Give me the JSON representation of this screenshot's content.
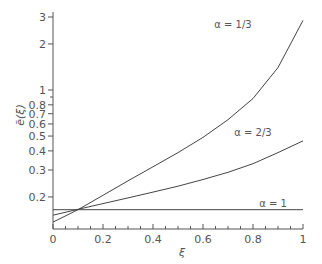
{
  "chart_data": {
    "type": "line",
    "title": "",
    "xlabel": "ξ",
    "ylabel": "ẽ(ξ)",
    "xlim": [
      0,
      1
    ],
    "ylim": [
      0.13,
      3.2
    ],
    "yscale": "log",
    "grid": false,
    "legend": "inline labels",
    "x_ticks": [
      0,
      0.2,
      0.4,
      0.6,
      0.8,
      1
    ],
    "x_tick_labels": [
      "0",
      "0.2",
      "0.4",
      "0.6",
      "0.8",
      "1"
    ],
    "x_minor_step": 0.05,
    "y_ticks": [
      0.2,
      0.3,
      0.4,
      0.5,
      0.6,
      0.7,
      0.8,
      1,
      2,
      3
    ],
    "y_tick_labels": [
      "0.2",
      "0.3",
      "0.4",
      "0.5",
      "0.6",
      "0.7",
      "0.8",
      "1",
      "2",
      "3"
    ],
    "y_minor_ticks": [
      0.9
    ],
    "x": [
      0,
      0.1,
      0.2,
      0.3,
      0.4,
      0.5,
      0.6,
      0.7,
      0.8,
      0.9,
      1.0
    ],
    "series": [
      {
        "name": "α = 1/3",
        "label_pos": [
          0.72,
          2.55
        ],
        "values": [
          0.137,
          0.165,
          0.205,
          0.255,
          0.315,
          0.39,
          0.49,
          0.64,
          0.88,
          1.4,
          2.85
        ]
      },
      {
        "name": "α = 2/3",
        "label_pos": [
          0.8,
          0.5
        ],
        "values": [
          0.152,
          0.166,
          0.181,
          0.197,
          0.215,
          0.235,
          0.26,
          0.29,
          0.33,
          0.39,
          0.465
        ]
      },
      {
        "name": "α = 1",
        "label_pos": [
          0.88,
          0.172
        ],
        "values": [
          0.165,
          0.165,
          0.165,
          0.165,
          0.165,
          0.165,
          0.165,
          0.165,
          0.165,
          0.165,
          0.165
        ]
      }
    ]
  },
  "colors": {
    "line": "#444444",
    "axis": "#555555",
    "text": "#555555"
  }
}
